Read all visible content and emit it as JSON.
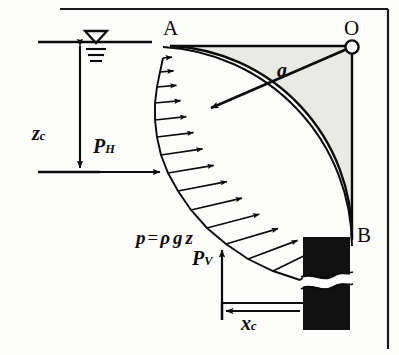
{
  "figure": {
    "type": "engineering-diagram",
    "background_color": "#fdfdfc",
    "ink_color": "#0c0c0c",
    "fill_color": "#e9e9e6",
    "wall_color": "#111111"
  },
  "labels": {
    "point_a": "A",
    "point_o": "O",
    "point_b": "B",
    "radius": "a",
    "depth_zc": "z",
    "depth_zc_sub": "c",
    "horizontal_force": "P",
    "horizontal_force_sub": "H",
    "vertical_force": "P",
    "vertical_force_sub": "V",
    "distance_xc": "x",
    "distance_xc_sub": "c",
    "pressure_eq_p": "p",
    "pressure_eq_equals": "=",
    "pressure_eq_rho": "ρ",
    "pressure_eq_g": "g",
    "pressure_eq_z": "z"
  },
  "geometry": {
    "frame": {
      "top_y": 8,
      "right_x": 389,
      "left_x": 6,
      "bottom_y": 348
    },
    "water_surface": {
      "y": 42,
      "x_start": 38,
      "x_end": 152
    },
    "water_symbol": {
      "triangle_cx": 96,
      "triangle_top_y": 30,
      "hatch_lines": 3
    },
    "point_a": {
      "x": 172,
      "y": 46
    },
    "point_o": {
      "x": 352,
      "y": 46
    },
    "point_b": {
      "x": 352,
      "y": 237
    },
    "arc_radius": 191,
    "arc_center": {
      "x": 352,
      "y": 46
    },
    "radius_arrow": {
      "from_x": 348,
      "from_y": 49,
      "to_x": 207,
      "to_y": 110
    },
    "baseline": {
      "y": 172,
      "x_start": 38,
      "x_end": 165
    },
    "zc_arrow": {
      "x": 80,
      "top_y": 44,
      "bottom_y": 170
    },
    "ph_arrow": {
      "y": 172,
      "from_x": 40,
      "to_x": 163
    },
    "pv_arrow": {
      "x": 222,
      "from_y": 320,
      "to_y": 252
    },
    "xc_arrow": {
      "y": 311,
      "from_x": 303,
      "to_x": 224
    },
    "wall_block": {
      "x": 303,
      "y": 237,
      "width": 47,
      "height": 93,
      "break_y": 277
    },
    "pressure_arrow_count": 12
  }
}
